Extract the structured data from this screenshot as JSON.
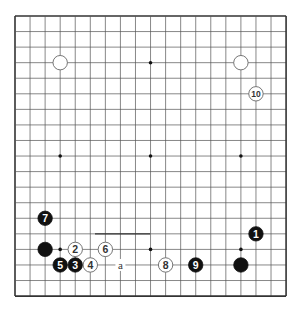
{
  "board": {
    "size": 19,
    "origin_x": 15,
    "origin_y": 16,
    "spacing_x": 15.06,
    "spacing_y": 15.56,
    "line_color": "#555555",
    "edge_color": "#333333",
    "star_points": [
      [
        3,
        3
      ],
      [
        9,
        3
      ],
      [
        15,
        3
      ],
      [
        3,
        9
      ],
      [
        9,
        9
      ],
      [
        15,
        9
      ],
      [
        3,
        15
      ],
      [
        9,
        15
      ],
      [
        15,
        15
      ]
    ]
  },
  "stones": [
    {
      "color": "white",
      "col": 3,
      "row": 3,
      "label": ""
    },
    {
      "color": "white",
      "col": 15,
      "row": 3,
      "label": ""
    },
    {
      "color": "white",
      "col": 16,
      "row": 5,
      "label": "10"
    },
    {
      "color": "black",
      "col": 16,
      "row": 14,
      "label": "1"
    },
    {
      "color": "black",
      "col": 15,
      "row": 16,
      "label": ""
    },
    {
      "color": "black",
      "col": 2,
      "row": 13,
      "label": "7"
    },
    {
      "color": "black",
      "col": 2,
      "row": 15,
      "label": ""
    },
    {
      "color": "white",
      "col": 4,
      "row": 15,
      "label": "2"
    },
    {
      "color": "white",
      "col": 6,
      "row": 15,
      "label": "6"
    },
    {
      "color": "black",
      "col": 3,
      "row": 16,
      "label": "5"
    },
    {
      "color": "black",
      "col": 4,
      "row": 16,
      "label": "3"
    },
    {
      "color": "white",
      "col": 5,
      "row": 16,
      "label": "4"
    },
    {
      "color": "white",
      "col": 10,
      "row": 16,
      "label": "8"
    },
    {
      "color": "black",
      "col": 12,
      "row": 16,
      "label": "9"
    }
  ],
  "markers": [
    {
      "col": 7,
      "row": 16,
      "label": "a"
    }
  ],
  "artifact_line": {
    "x1": 95,
    "x2": 150,
    "row": 14
  }
}
